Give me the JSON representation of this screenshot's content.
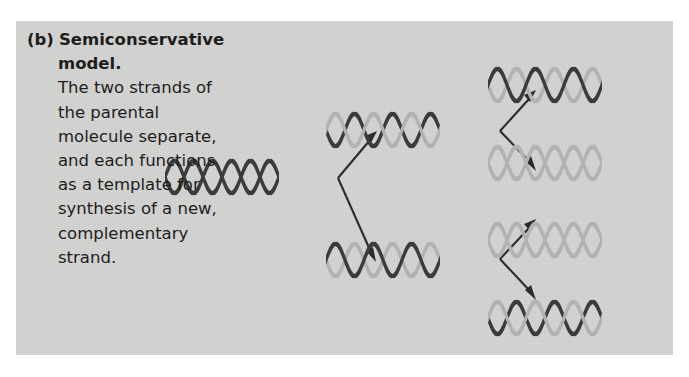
{
  "figure": {
    "panel_background": "#d3d3d1",
    "page_background": "#ffffff",
    "caption": {
      "label": "(b)",
      "heading": "Semiconservative model.",
      "body": "The two strands of the parental molecule separate, and each functions as a template for synthesis of a new, complementary strand."
    },
    "colors": {
      "parental_strand": "#3b3b3b",
      "new_strand": "#b2b2b0",
      "arrow": "#2b2b2b"
    },
    "legend_meaning": {
      "dark_strand": "parental (old) strand",
      "light_strand": "newly synthesized strand"
    },
    "diagram": {
      "type": "dna-replication-branching",
      "generations": [
        {
          "name": "parental",
          "molecules": [
            {
              "id": "parent",
              "strands": [
                "dark",
                "dark"
              ],
              "x": 222,
              "y": 177
            }
          ]
        },
        {
          "name": "first-replication",
          "molecules": [
            {
              "id": "gen1-top",
              "strands": [
                "dark",
                "light"
              ],
              "x": 383,
              "y": 130
            },
            {
              "id": "gen1-bottom",
              "strands": [
                "light",
                "dark"
              ],
              "x": 383,
              "y": 260
            }
          ]
        },
        {
          "name": "second-replication",
          "molecules": [
            {
              "id": "gen2-1",
              "strands": [
                "light",
                "dark"
              ],
              "x": 545,
              "y": 85
            },
            {
              "id": "gen2-2",
              "strands": [
                "light",
                "light"
              ],
              "x": 545,
              "y": 163
            },
            {
              "id": "gen2-3",
              "strands": [
                "light",
                "light"
              ],
              "x": 545,
              "y": 240
            },
            {
              "id": "gen2-4",
              "strands": [
                "dark",
                "light"
              ],
              "x": 545,
              "y": 318
            }
          ]
        }
      ],
      "arrows": [
        {
          "id": "parent-to-gen1-top",
          "from": [
            338,
            177
          ],
          "to": [
            375,
            133
          ]
        },
        {
          "id": "parent-to-gen1-bottom",
          "from": [
            338,
            177
          ],
          "to": [
            375,
            255
          ]
        },
        {
          "id": "gen1-top-to-gen2-1",
          "from": [
            500,
            130
          ],
          "to": [
            534,
            92
          ]
        },
        {
          "id": "gen1-top-to-gen2-2",
          "from": [
            500,
            130
          ],
          "to": [
            534,
            168
          ]
        },
        {
          "id": "gen1-bottom-to-gen2-3",
          "from": [
            500,
            260
          ],
          "to": [
            534,
            222
          ]
        },
        {
          "id": "gen1-bottom-to-gen2-4",
          "from": [
            500,
            260
          ],
          "to": [
            534,
            298
          ]
        }
      ]
    }
  }
}
